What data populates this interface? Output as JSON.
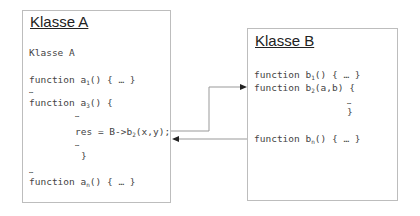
{
  "classA": {
    "title": "Klasse A",
    "subtitle": "Klasse A",
    "lines": [
      {
        "pre": "function a",
        "sub": "1",
        "post": "() { … }"
      },
      {
        "text": "…"
      },
      {
        "pre": "function a",
        "sub": "3",
        "post": "() {"
      },
      {
        "text": "…"
      },
      {
        "pre": "res = B->b",
        "sub": "2",
        "post": "(x,y);"
      },
      {
        "text": "…"
      },
      {
        "text": "}"
      },
      {
        "text": "…"
      },
      {
        "pre": "function a",
        "sub": "n",
        "post": "() { … }"
      }
    ]
  },
  "classB": {
    "title": "Klasse B",
    "lines": [
      {
        "pre": "function b",
        "sub": "1",
        "post": "() { … }"
      },
      {
        "pre": "function b",
        "sub": "2",
        "post": "(a,b) {"
      },
      {
        "text": "…"
      },
      {
        "text": "}"
      },
      {
        "pre": "function b",
        "sub": "n",
        "post": "() { … }"
      }
    ]
  },
  "arrows": [
    {
      "from": "a3 call",
      "to": "b2",
      "label": "call"
    },
    {
      "from": "b2",
      "to": "a3",
      "label": "return"
    }
  ],
  "colors": {
    "border": "#bdbdbd",
    "arrow": "#888888",
    "text": "#444444"
  }
}
